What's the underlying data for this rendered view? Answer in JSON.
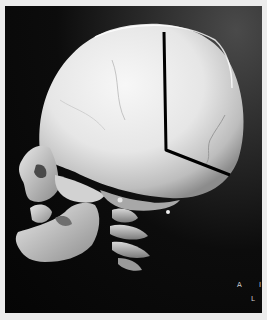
{
  "image": {
    "subject": "3D CT volume rendering of infant skull, left lateral view",
    "annotation": {
      "type": "polyline",
      "color": "#000000",
      "points": [
        [
          164,
          32
        ],
        [
          166,
          150
        ],
        [
          230,
          175
        ]
      ]
    },
    "orientation_labels": {
      "a": "A",
      "l": "L",
      "edge": "I"
    },
    "colors": {
      "border": "#ececec",
      "background": "#050505",
      "bone_light": "#f2f2f2",
      "bone_shadow": "#8a8a8a"
    }
  }
}
